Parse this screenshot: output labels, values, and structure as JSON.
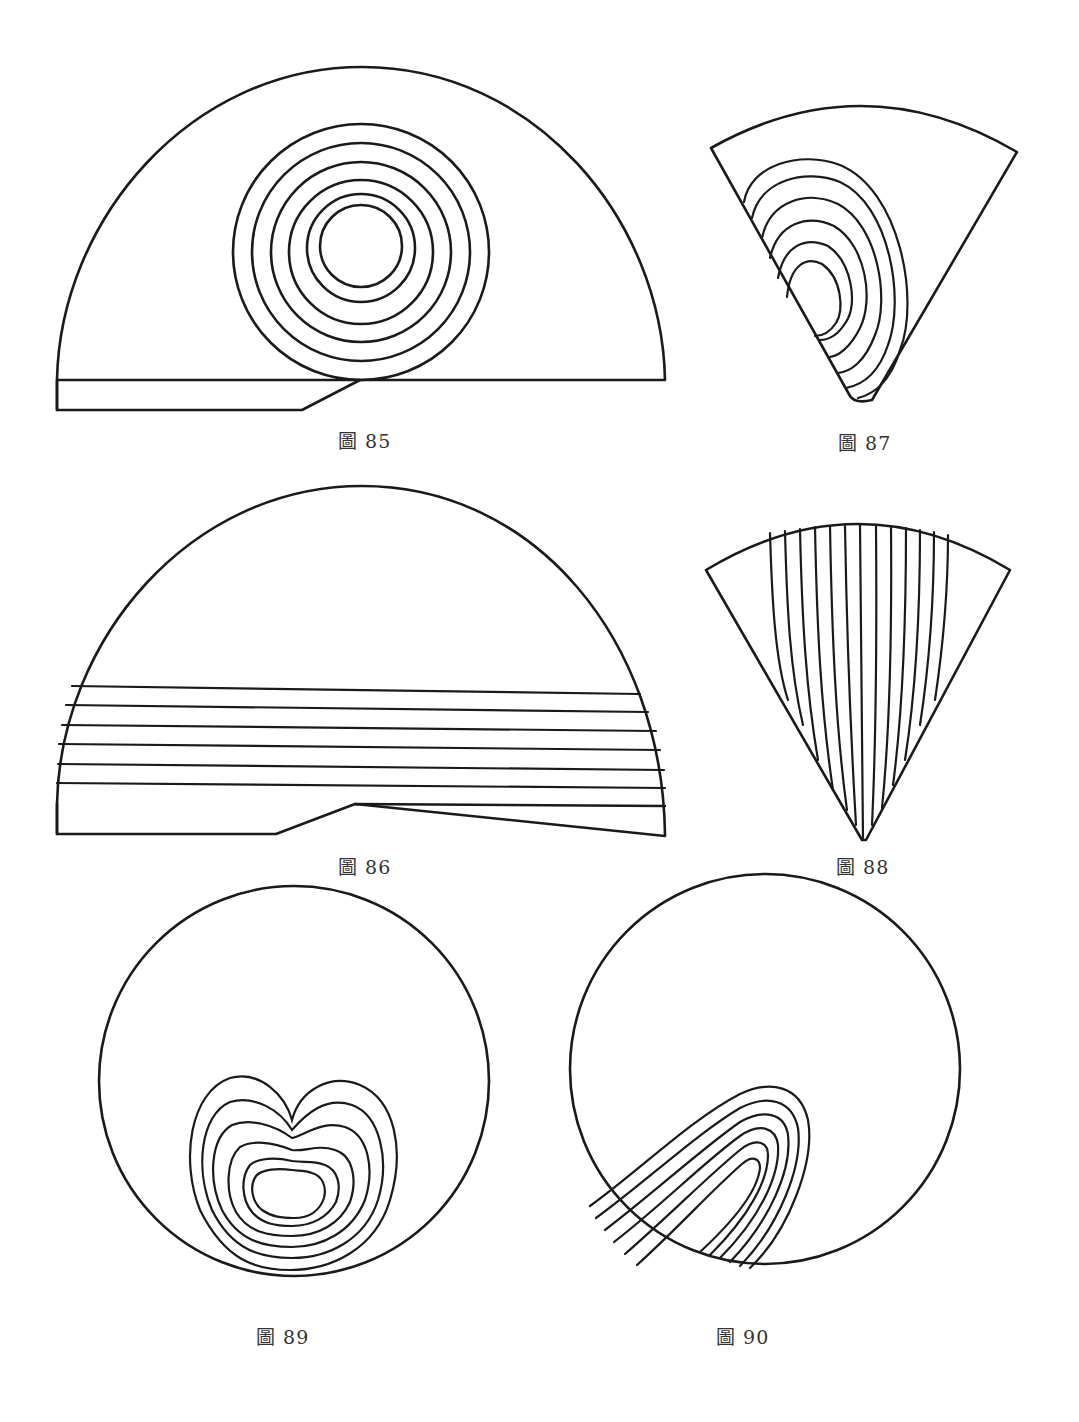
{
  "page": {
    "background": "#ffffff",
    "ink_color": "#1a1a1a"
  },
  "figures": [
    {
      "id": "fig85",
      "caption": "圖 85",
      "shape": "half-disc with base plate",
      "pattern": "6 concentric circles",
      "ring_count": 6
    },
    {
      "id": "fig86",
      "caption": "圖 86",
      "shape": "half-disc with base plate",
      "pattern": "7 horizontal parallel lines",
      "line_count": 7
    },
    {
      "id": "fig87",
      "caption": "圖 87",
      "shape": "fan / circular sector",
      "pattern": "6 nested D-shaped curves against left edge",
      "ring_count": 6
    },
    {
      "id": "fig88",
      "caption": "圖 88",
      "shape": "fan / circular sector",
      "pattern": "13 near-vertical lines converging to apex",
      "line_count": 13
    },
    {
      "id": "fig89",
      "caption": "圖 89",
      "shape": "circle",
      "pattern": "6 nested heart / kidney-shaped curves",
      "ring_count": 6
    },
    {
      "id": "fig90",
      "caption": "圖 90",
      "shape": "circle",
      "pattern": "6 nested inverted-U curves, slanted",
      "ring_count": 6
    }
  ]
}
